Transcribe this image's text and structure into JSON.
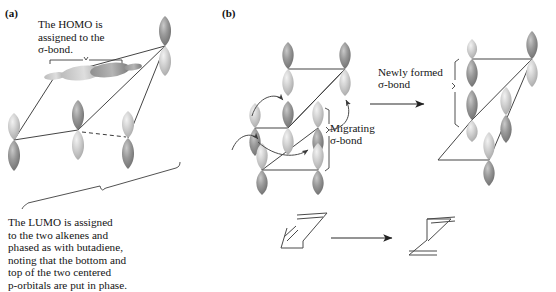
{
  "figure": {
    "type": "orbital-diagram",
    "background": "#ffffff",
    "ink_color": "#2b2b2b",
    "orbital_fill_light": "#d9d9d9",
    "orbital_fill_dark": "#8d8d8d",
    "panels": [
      {
        "id": "a",
        "label": "(a)",
        "captions": [
          {
            "id": "homo",
            "text": "The HOMO is\nassigned to the\nσ-bond."
          },
          {
            "id": "lumo",
            "text": "The LUMO is assigned\nto the two alkenes and\nphased as with butadiene,\nnoting that the bottom and\ntop of the two centered\np-orbitals are put in phase."
          }
        ]
      },
      {
        "id": "b",
        "label": "(b)",
        "captions": [
          {
            "id": "migrating",
            "text": "Migrating\nσ-bond"
          },
          {
            "id": "newly-formed",
            "text": "Newly formed\nσ-bond"
          }
        ],
        "reaction": {
          "arrow": "straight-right-arrow",
          "reactant": "skeletal-structure-reactant",
          "product": "skeletal-structure-product"
        }
      }
    ]
  }
}
